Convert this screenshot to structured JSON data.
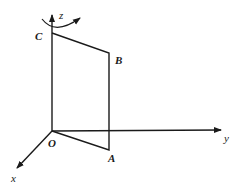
{
  "diagram": {
    "type": "3d-axes-with-rotating-frame",
    "axes": {
      "x": "x",
      "y": "y",
      "z": "z"
    },
    "points": {
      "origin": "O",
      "A": "A",
      "B": "B",
      "C": "C"
    },
    "rotation_indicator": "curved arrow around z-axis",
    "colors": {
      "stroke": "#1a1a1a",
      "background": "#ffffff"
    }
  }
}
